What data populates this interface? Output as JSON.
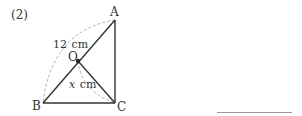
{
  "problem": {
    "number_label": "(2)"
  },
  "diagram": {
    "points": {
      "A": {
        "label": "A",
        "x": 115,
        "y": 20
      },
      "B": {
        "label": "B",
        "x": 43,
        "y": 103
      },
      "C": {
        "label": "C",
        "x": 115,
        "y": 103
      },
      "O": {
        "label": "O",
        "x": 78,
        "y": 61
      }
    },
    "segments": [
      "AB",
      "BC",
      "CA",
      "OC"
    ],
    "arcs": [
      {
        "from": "A",
        "to": "B",
        "style": "dashed",
        "label": "12 cm",
        "label_num": "12",
        "label_unit": "cm"
      },
      {
        "from": "O",
        "to": "C",
        "style": "dashed",
        "label": "x cm",
        "label_var": "x",
        "label_unit": "cm"
      }
    ],
    "colors": {
      "line": "#333333",
      "dashed": "#a0a0a0",
      "text": "#333333"
    }
  },
  "answer": {
    "blank_line": true
  }
}
